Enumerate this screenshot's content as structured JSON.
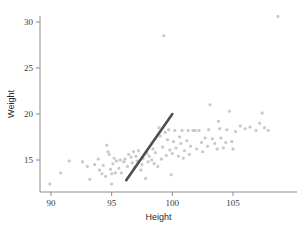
{
  "chart_data": {
    "type": "scatter",
    "title": "",
    "xlabel": "Height",
    "ylabel": "Weight",
    "xlim": [
      88.8,
      109.6
    ],
    "ylim": [
      11.6,
      31.4
    ],
    "xticks": [
      90,
      95,
      100,
      105
    ],
    "yticks": [
      15,
      20,
      25,
      30
    ],
    "xtick_labels": [
      "90",
      "95",
      "100",
      "105"
    ],
    "ytick_labels": [
      "15",
      "20",
      "25",
      "30"
    ],
    "grid": false,
    "legend": null,
    "point_color": "#c9c9c9",
    "line_color": "#4f4f4f",
    "axis_color": "#8c8c8c",
    "background": "#ffffff",
    "series": [
      {
        "name": "observations",
        "marker": "square",
        "points": [
          [
            89.9,
            12.4
          ],
          [
            90.8,
            13.6
          ],
          [
            91.5,
            14.9
          ],
          [
            92.6,
            14.8
          ],
          [
            93.0,
            14.3
          ],
          [
            93.2,
            12.9
          ],
          [
            93.6,
            14.5
          ],
          [
            93.9,
            15.1
          ],
          [
            94.0,
            13.9
          ],
          [
            94.2,
            13.5
          ],
          [
            94.3,
            14.4
          ],
          [
            94.5,
            13.2
          ],
          [
            94.6,
            16.6
          ],
          [
            94.7,
            15.9
          ],
          [
            94.8,
            15.6
          ],
          [
            94.9,
            14.0
          ],
          [
            95.0,
            13.5
          ],
          [
            95.0,
            12.4
          ],
          [
            95.1,
            14.6
          ],
          [
            95.2,
            15.2
          ],
          [
            95.3,
            13.6
          ],
          [
            95.4,
            14.9
          ],
          [
            95.6,
            14.1
          ],
          [
            95.7,
            15.0
          ],
          [
            95.8,
            13.6
          ],
          [
            96.0,
            14.8
          ],
          [
            96.1,
            15.1
          ],
          [
            96.3,
            14.3
          ],
          [
            96.4,
            15.6
          ],
          [
            96.6,
            15.3
          ],
          [
            96.7,
            14.7
          ],
          [
            96.8,
            15.9
          ],
          [
            96.9,
            14.2
          ],
          [
            97.0,
            15.4
          ],
          [
            97.1,
            14.9
          ],
          [
            97.2,
            16.0
          ],
          [
            97.4,
            13.9
          ],
          [
            97.5,
            14.5
          ],
          [
            97.6,
            15.2
          ],
          [
            97.8,
            13.0
          ],
          [
            97.9,
            15.7
          ],
          [
            98.0,
            14.8
          ],
          [
            98.1,
            15.4
          ],
          [
            98.3,
            15.0
          ],
          [
            98.4,
            16.2
          ],
          [
            98.5,
            14.6
          ],
          [
            98.6,
            15.8
          ],
          [
            98.8,
            14.3
          ],
          [
            98.9,
            18.5
          ],
          [
            99.0,
            17.6
          ],
          [
            99.1,
            15.1
          ],
          [
            99.2,
            16.4
          ],
          [
            99.3,
            28.5
          ],
          [
            99.4,
            18.0
          ],
          [
            99.5,
            15.5
          ],
          [
            99.6,
            17.2
          ],
          [
            99.7,
            18.3
          ],
          [
            99.8,
            16.1
          ],
          [
            99.9,
            13.4
          ],
          [
            100.0,
            15.7
          ],
          [
            100.1,
            17.0
          ],
          [
            100.2,
            18.2
          ],
          [
            100.3,
            16.3
          ],
          [
            100.5,
            15.4
          ],
          [
            100.6,
            17.5
          ],
          [
            100.7,
            16.8
          ],
          [
            100.8,
            18.2
          ],
          [
            100.9,
            15.2
          ],
          [
            101.0,
            16.0
          ],
          [
            101.2,
            17.1
          ],
          [
            101.3,
            18.2
          ],
          [
            101.4,
            15.6
          ],
          [
            101.5,
            16.5
          ],
          [
            101.7,
            18.2
          ],
          [
            101.9,
            18.2
          ],
          [
            102.0,
            16.2
          ],
          [
            102.2,
            18.2
          ],
          [
            102.4,
            16.9
          ],
          [
            102.5,
            15.9
          ],
          [
            102.7,
            17.4
          ],
          [
            102.9,
            16.5
          ],
          [
            103.0,
            18.3
          ],
          [
            103.1,
            21.0
          ],
          [
            103.3,
            17.3
          ],
          [
            103.5,
            16.8
          ],
          [
            103.7,
            16.2
          ],
          [
            103.8,
            19.2
          ],
          [
            103.9,
            18.4
          ],
          [
            104.0,
            17.4
          ],
          [
            104.2,
            16.3
          ],
          [
            104.4,
            16.9
          ],
          [
            104.5,
            18.3
          ],
          [
            104.7,
            20.3
          ],
          [
            104.9,
            17.0
          ],
          [
            105.0,
            16.2
          ],
          [
            105.2,
            18.1
          ],
          [
            105.6,
            18.7
          ],
          [
            106.0,
            18.4
          ],
          [
            106.4,
            18.6
          ],
          [
            106.9,
            18.2
          ],
          [
            107.2,
            19.0
          ],
          [
            107.4,
            20.1
          ],
          [
            107.6,
            18.5
          ],
          [
            107.9,
            18.2
          ],
          [
            108.7,
            30.6
          ]
        ]
      }
    ],
    "fit_line": {
      "name": "fitted-line",
      "x_start": 96.2,
      "y_start": 12.8,
      "x_end": 100.0,
      "y_end": 20.0
    }
  }
}
